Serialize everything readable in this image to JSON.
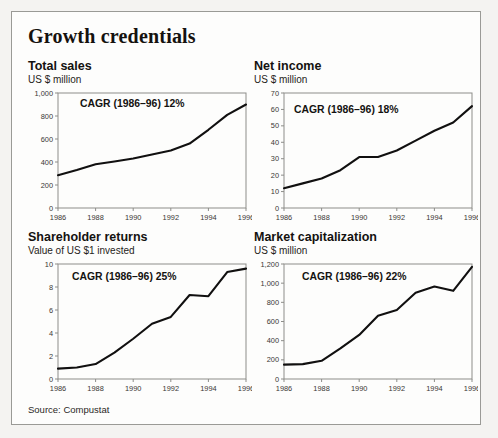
{
  "figure": {
    "title": "Growth credentials",
    "source": "Source: Compustat"
  },
  "chart_data": [
    {
      "type": "line",
      "title": "Total sales",
      "subtitle": "US $ million",
      "annotation": "CAGR (1986–96) 12%",
      "xlabel": "",
      "ylabel": "US $ million",
      "x": [
        1986,
        1987,
        1988,
        1989,
        1990,
        1991,
        1992,
        1993,
        1994,
        1995,
        1996
      ],
      "values": [
        285,
        330,
        380,
        405,
        430,
        465,
        500,
        560,
        680,
        810,
        900
      ],
      "xlim": [
        1986,
        1996
      ],
      "ylim": [
        0,
        1000
      ],
      "yticks": [
        0,
        200,
        400,
        600,
        800,
        1000
      ],
      "ytick_labels": [
        "0",
        "200",
        "400",
        "600",
        "800",
        "1,000"
      ],
      "xticks": [
        1986,
        1988,
        1990,
        1992,
        1994,
        1996
      ],
      "xtick_labels": [
        "1986",
        "1988",
        "1990",
        "1992",
        "1994",
        "1996"
      ],
      "grid": false,
      "legend": "none"
    },
    {
      "type": "line",
      "title": "Net income",
      "subtitle": "US $ million",
      "annotation": "CAGR (1986–96) 18%",
      "xlabel": "",
      "ylabel": "US $ million",
      "x": [
        1986,
        1987,
        1988,
        1989,
        1990,
        1991,
        1992,
        1993,
        1994,
        1995,
        1996
      ],
      "values": [
        12,
        15,
        18,
        23,
        31,
        31,
        35,
        41,
        47,
        52,
        62
      ],
      "xlim": [
        1986,
        1996
      ],
      "ylim": [
        0,
        70
      ],
      "yticks": [
        0,
        10,
        20,
        30,
        40,
        50,
        60,
        70
      ],
      "ytick_labels": [
        "0",
        "10",
        "20",
        "30",
        "40",
        "50",
        "60",
        "70"
      ],
      "xticks": [
        1986,
        1988,
        1990,
        1992,
        1994,
        1996
      ],
      "xtick_labels": [
        "1986",
        "1988",
        "1990",
        "1992",
        "1994",
        "1996"
      ],
      "grid": false,
      "legend": "none"
    },
    {
      "type": "line",
      "title": "Shareholder returns",
      "subtitle": "Value of US $1 invested",
      "annotation": "CAGR (1986–96) 25%",
      "xlabel": "",
      "ylabel": "Value of US $1 invested",
      "x": [
        1986,
        1987,
        1988,
        1989,
        1990,
        1991,
        1992,
        1993,
        1994,
        1995,
        1996
      ],
      "values": [
        0.9,
        1.0,
        1.3,
        2.3,
        3.5,
        4.8,
        5.4,
        7.3,
        7.2,
        9.3,
        9.6
      ],
      "xlim": [
        1986,
        1996
      ],
      "ylim": [
        0,
        10
      ],
      "yticks": [
        0,
        2,
        4,
        6,
        8,
        10
      ],
      "ytick_labels": [
        "0",
        "2",
        "4",
        "6",
        "8",
        "10"
      ],
      "xticks": [
        1986,
        1988,
        1990,
        1992,
        1994,
        1996
      ],
      "xtick_labels": [
        "1986",
        "1988",
        "1990",
        "1992",
        "1994",
        "1996"
      ],
      "grid": false,
      "legend": "none"
    },
    {
      "type": "line",
      "title": "Market capitalization",
      "subtitle": "US $ million",
      "annotation": "CAGR (1986–96) 22%",
      "xlabel": "",
      "ylabel": "US $ million",
      "x": [
        1986,
        1987,
        1988,
        1989,
        1990,
        1991,
        1992,
        1993,
        1994,
        1995,
        1996
      ],
      "values": [
        150,
        155,
        190,
        320,
        460,
        660,
        720,
        900,
        965,
        920,
        1170
      ],
      "xlim": [
        1986,
        1996
      ],
      "ylim": [
        0,
        1200
      ],
      "yticks": [
        0,
        200,
        400,
        600,
        800,
        1000,
        1200
      ],
      "ytick_labels": [
        "0",
        "200",
        "400",
        "600",
        "800",
        "1,000",
        "1,200"
      ],
      "xticks": [
        1986,
        1988,
        1990,
        1992,
        1994,
        1996
      ],
      "xtick_labels": [
        "1986",
        "1988",
        "1990",
        "1992",
        "1994",
        "1996"
      ],
      "grid": false,
      "legend": "none"
    }
  ],
  "colors": {
    "line": "#111010",
    "axis": "#8d8d89",
    "text": "#141210",
    "page_background": "#f4f3f1",
    "box_background": "#fdfdfc"
  }
}
